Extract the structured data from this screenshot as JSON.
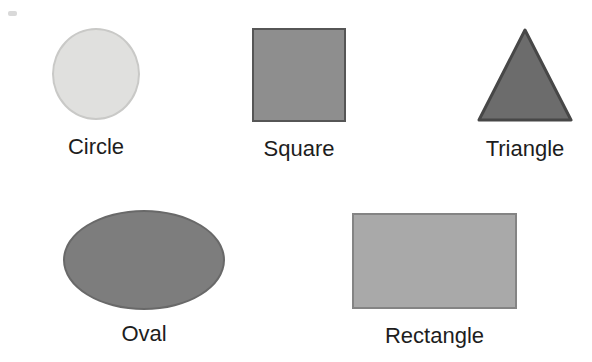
{
  "page": {
    "background": "#ffffff",
    "label_color": "#1d1d1d"
  },
  "shapes": [
    {
      "name": "circle",
      "label": "Circle",
      "fill": "#e0e0de",
      "border": "#c9c9c7"
    },
    {
      "name": "square",
      "label": "Square",
      "fill": "#8e8e8e",
      "border": "#565656"
    },
    {
      "name": "triangle",
      "label": "Triangle",
      "fill": "#6c6c6c",
      "border": "#474747"
    },
    {
      "name": "oval",
      "label": "Oval",
      "fill": "#7d7d7d",
      "border": "#696969"
    },
    {
      "name": "rectangle",
      "label": "Rectangle",
      "fill": "#a9a9a9",
      "border": "#848484"
    }
  ]
}
